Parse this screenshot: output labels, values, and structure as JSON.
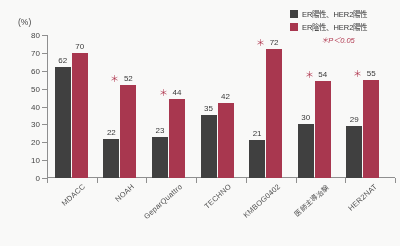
{
  "legend": {
    "position": "top-right",
    "entries": [
      {
        "label": "ER陽性、HER2陽性",
        "color": "#3a3a3a",
        "swatch": "dark-swatch-icon"
      },
      {
        "label": "ER陰性、HER2陽性",
        "color": "#a8304a",
        "swatch": "red-swatch-icon"
      }
    ],
    "significance_note": "＊P＜0.05"
  },
  "axis": {
    "y_unit": "(%)",
    "y_ticks": [
      "0",
      "10",
      "20",
      "30",
      "40",
      "50",
      "60",
      "70",
      "80"
    ]
  },
  "chart_data": {
    "type": "bar",
    "title": "",
    "xlabel": "",
    "ylabel": "(%)",
    "ylim": [
      0,
      80
    ],
    "ystep": 10,
    "grid": false,
    "legend_position": "top-right",
    "categories": [
      "MDACC",
      "NOAH",
      "GeparQuattro",
      "TECHNO",
      "KMBOG0402",
      "医師主導治験",
      "HER2NAT"
    ],
    "series": [
      {
        "name": "ER陽性、HER2陽性",
        "color": "#3a3a3a",
        "values": [
          62,
          22,
          23,
          35,
          21,
          30,
          29
        ]
      },
      {
        "name": "ER陰性、HER2陽性",
        "color": "#a8304a",
        "values": [
          70,
          52,
          44,
          42,
          72,
          54,
          55
        ]
      }
    ],
    "annotations": {
      "significance_marker": "＊",
      "significance_label": "＊P＜0.05",
      "significant_categories": [
        "NOAH",
        "GeparQuattro",
        "KMBOG0402",
        "医師主導治験",
        "HER2NAT"
      ]
    }
  }
}
